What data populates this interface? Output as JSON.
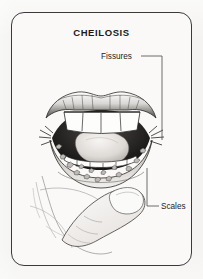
{
  "card": {
    "title": "CHEILOSIS",
    "border_color": "#3a3a3e",
    "background_color": "#faf9f8"
  },
  "page": {
    "background_color": "#f4f3f1"
  },
  "callouts": [
    {
      "name": "fissures",
      "label": "Fissures",
      "points_to": "corner-of-mouth"
    },
    {
      "name": "scales",
      "label": "Scales",
      "points_to": "lower-lip-scaling"
    }
  ],
  "illustration": {
    "name": "open-mouth-with-cheilosis",
    "description": "Line drawing of an open mouth, upper and lower teeth, tongue, with fissured mouth corners and scaly lower lip; a finger pulls the lower lip down",
    "ink_color": "#2b2b2b"
  }
}
